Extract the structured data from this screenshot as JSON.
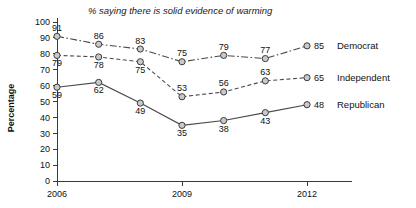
{
  "chart_data": {
    "type": "line",
    "title": "% saying there is solid evidence of warming",
    "xlabel": "",
    "ylabel": "Percentage",
    "x": [
      2006,
      2007,
      2008,
      2009,
      2010,
      2011,
      2012
    ],
    "xtick_labels": [
      "2006",
      "2009",
      "2012"
    ],
    "xticks": [
      2006,
      2009,
      2012
    ],
    "ytick_labels": [
      "0",
      "10",
      "20",
      "30",
      "40",
      "50",
      "60",
      "70",
      "80",
      "90",
      "100"
    ],
    "yticks": [
      0,
      10,
      20,
      30,
      40,
      50,
      60,
      70,
      80,
      90,
      100
    ],
    "ylim": [
      0,
      100
    ],
    "xlim": [
      2006,
      2012
    ],
    "grid": false,
    "legend_position": "right-end-of-line",
    "series": [
      {
        "name": "Democrat",
        "line_style": "dash-dot",
        "values": [
          91,
          86,
          83,
          75,
          79,
          77,
          85
        ],
        "labels": [
          "91",
          "86",
          "83",
          "75",
          "79",
          "77",
          "85"
        ],
        "end_label": "85"
      },
      {
        "name": "Independent",
        "line_style": "dashed",
        "values": [
          79,
          78,
          75,
          53,
          56,
          63,
          65
        ],
        "labels": [
          "79",
          "78",
          "75",
          "53",
          "56",
          "63",
          "65"
        ],
        "end_label": "65"
      },
      {
        "name": "Republican",
        "line_style": "solid",
        "values": [
          59,
          62,
          49,
          35,
          38,
          43,
          48
        ],
        "labels": [
          "59",
          "62",
          "49",
          "35",
          "38",
          "43",
          "48"
        ],
        "end_label": "48"
      }
    ]
  },
  "colors": {
    "marker_fill": "#c9c9c9",
    "marker_stroke": "#3d3d3d",
    "line": "#4a4a4a",
    "axis": "#3a3a3a",
    "text": "#111111",
    "background": "#ffffff"
  }
}
